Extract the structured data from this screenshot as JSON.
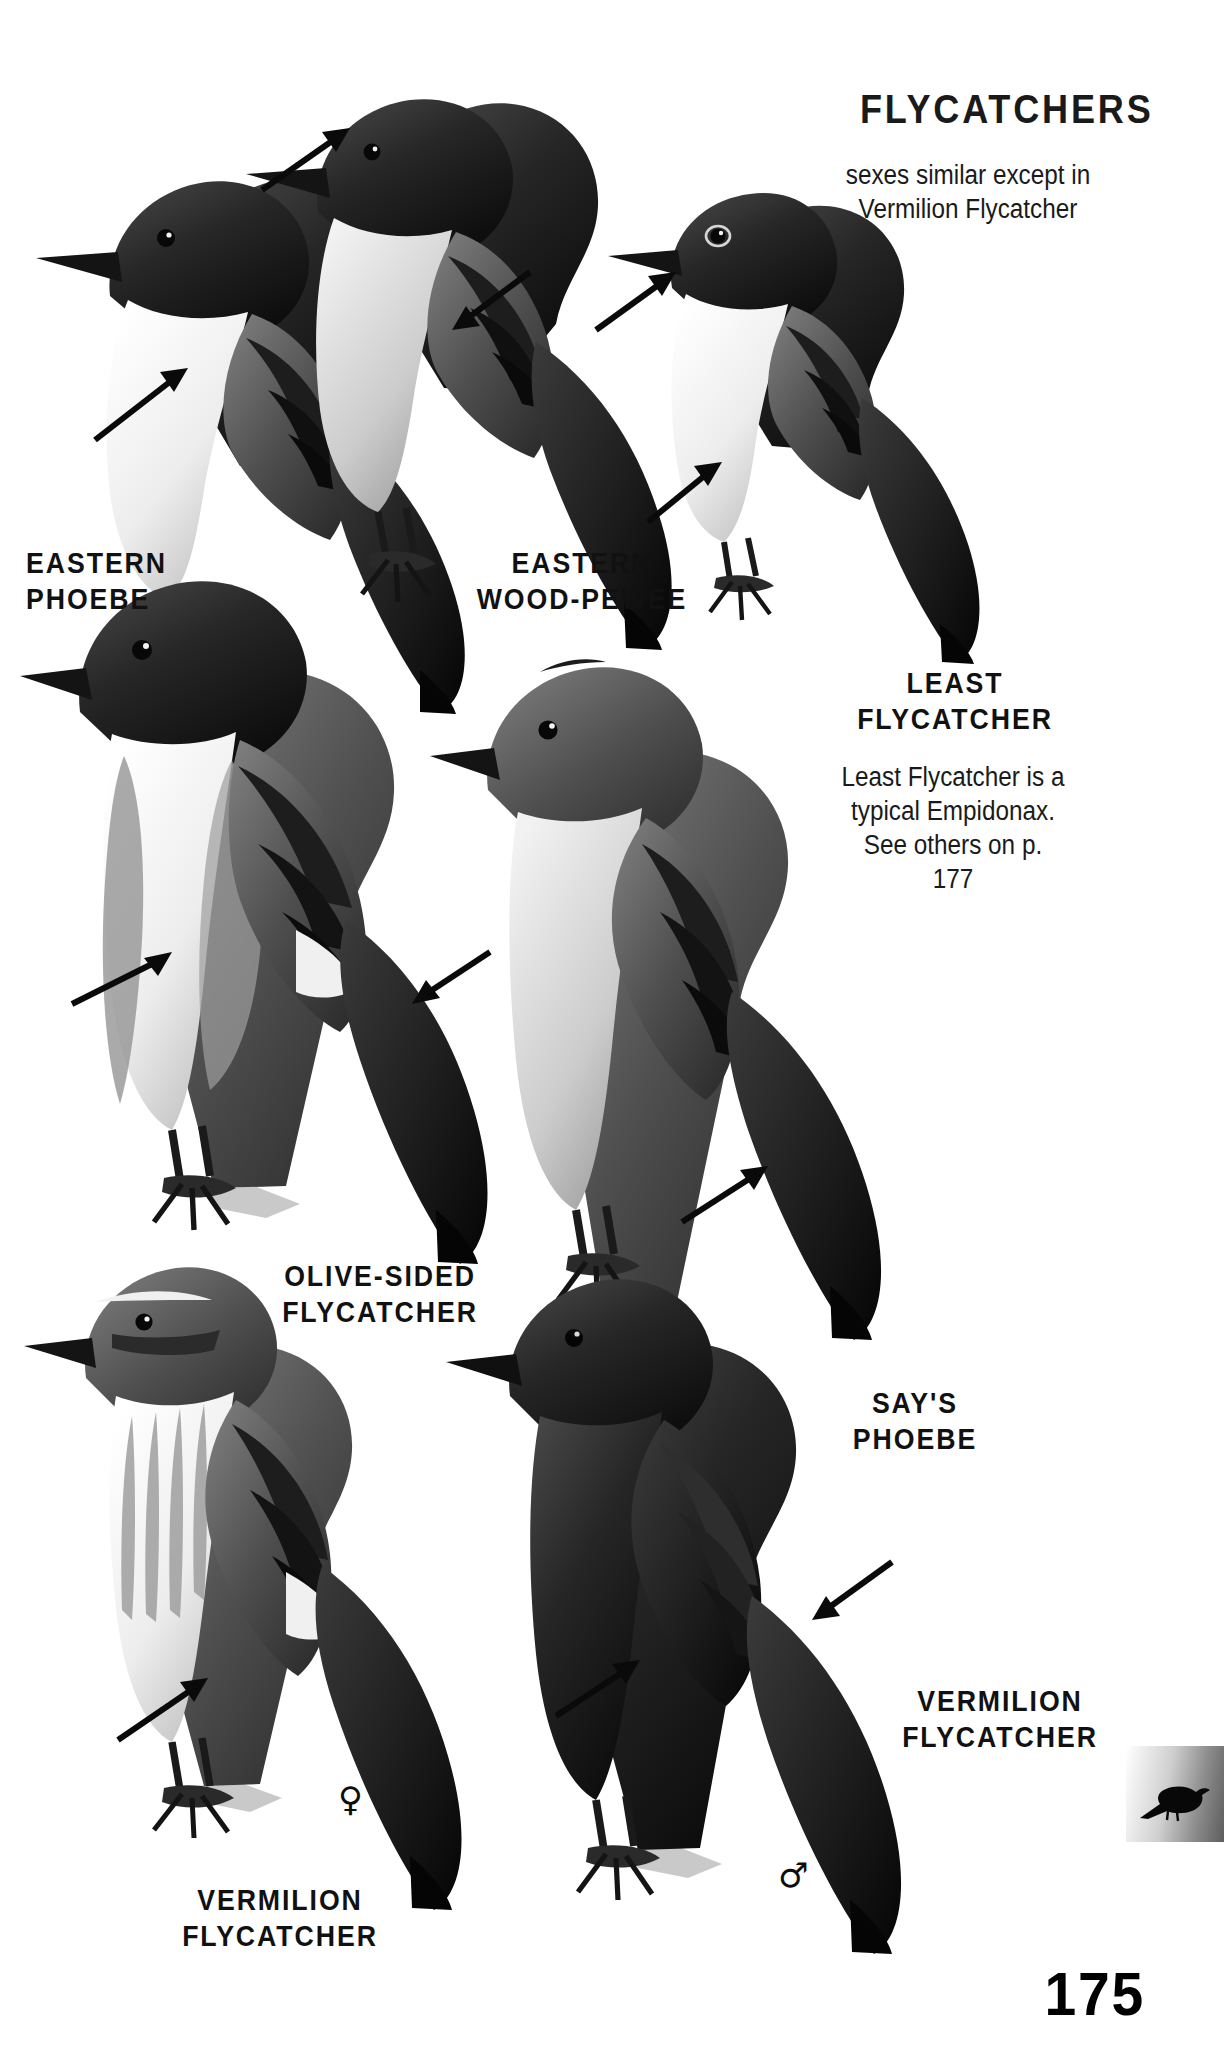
{
  "page": {
    "number": "175",
    "background_color": "#ffffff",
    "ink_color": "#111111",
    "width": 1224,
    "height": 2063
  },
  "header": {
    "title": "FLYCATCHERS",
    "note_line_1": "sexes similar except in",
    "note_line_2": "Vermilion Flycatcher"
  },
  "side_note": {
    "line_1": "Least Flycatcher is a",
    "line_2": "typical Empidonax.",
    "line_3": "See others on p. 177"
  },
  "species": [
    {
      "id": "eastern-phoebe",
      "label": "EASTERN\nPHOEBE",
      "label_x": 18,
      "label_y": 545,
      "sex": ""
    },
    {
      "id": "eastern-wood-pewee",
      "label": "EASTERN\nWOOD-PEWEE",
      "label_x": 452,
      "label_y": 545,
      "sex": ""
    },
    {
      "id": "least-flycatcher",
      "label": "LEAST\nFLYCATCHER",
      "label_x": 830,
      "label_y": 665,
      "sex": ""
    },
    {
      "id": "olive-sided-flycatcher",
      "label": "OLIVE-SIDED\nFLYCATCHER",
      "label_x": 255,
      "label_y": 1258,
      "sex": ""
    },
    {
      "id": "says-phoebe",
      "label": "SAY'S\nPHOEBE",
      "label_x": 820,
      "label_y": 1385,
      "sex": ""
    },
    {
      "id": "vermilion-flycatcher-male",
      "label": "VERMILION\nFLYCATCHER",
      "label_x": 880,
      "label_y": 1683,
      "sex": "♂"
    },
    {
      "id": "vermilion-flycatcher-female",
      "label": "VERMILION\nFLYCATCHER",
      "label_x": 140,
      "label_y": 1882,
      "sex": "♀"
    }
  ],
  "sex_symbols": [
    {
      "id": "female-symbol",
      "glyph": "♀",
      "x": 338,
      "y": 1782
    },
    {
      "id": "male-symbol",
      "glyph": "♂",
      "x": 778,
      "y": 1858
    }
  ],
  "thumb_tab": {
    "icon": "bird-silhouette-icon",
    "x": 1126,
    "y": 1746,
    "width": 98,
    "height": 96
  },
  "illustrations": [
    {
      "id": "eastern-phoebe-bird",
      "name": "eastern-phoebe-illustration"
    },
    {
      "id": "eastern-wood-pewee-bird",
      "name": "eastern-wood-pewee-illustration"
    },
    {
      "id": "least-flycatcher-bird",
      "name": "least-flycatcher-illustration"
    },
    {
      "id": "olive-sided-flycatcher-bird",
      "name": "olive-sided-flycatcher-illustration"
    },
    {
      "id": "says-phoebe-bird",
      "name": "says-phoebe-illustration"
    },
    {
      "id": "vermilion-flycatcher-female-bird",
      "name": "vermilion-flycatcher-female-illustration"
    },
    {
      "id": "vermilion-flycatcher-male-bird",
      "name": "vermilion-flycatcher-male-illustration"
    }
  ],
  "field_mark_pointers": [
    {
      "id": "pointer-eastern-phoebe",
      "x1": 95,
      "y1": 440,
      "x2": 188,
      "y2": 368
    },
    {
      "id": "pointer-eastern-wood-pewee-throat",
      "x1": 262,
      "y1": 190,
      "x2": 350,
      "y2": 128
    },
    {
      "id": "pointer-eastern-wood-pewee-wingbar",
      "x1": 530,
      "y1": 272,
      "x2": 452,
      "y2": 330
    },
    {
      "id": "pointer-least-flycatcher-eyering",
      "x1": 596,
      "y1": 330,
      "x2": 676,
      "y2": 272
    },
    {
      "id": "pointer-least-flycatcher-wingbar",
      "x1": 648,
      "y1": 522,
      "x2": 722,
      "y2": 462
    },
    {
      "id": "pointer-olive-sided-vest",
      "x1": 72,
      "y1": 1004,
      "x2": 172,
      "y2": 952
    },
    {
      "id": "pointer-olive-sided-flank",
      "x1": 490,
      "y1": 952,
      "x2": 412,
      "y2": 1004
    },
    {
      "id": "pointer-says-phoebe-belly",
      "x1": 682,
      "y1": 1222,
      "x2": 768,
      "y2": 1166
    },
    {
      "id": "pointer-vermilion-female-belly",
      "x1": 118,
      "y1": 1740,
      "x2": 208,
      "y2": 1678
    },
    {
      "id": "pointer-vermilion-male-body",
      "x1": 556,
      "y1": 1716,
      "x2": 640,
      "y2": 1660
    },
    {
      "id": "pointer-vermilion-male-wing",
      "x1": 892,
      "y1": 1562,
      "x2": 812,
      "y2": 1620
    }
  ]
}
